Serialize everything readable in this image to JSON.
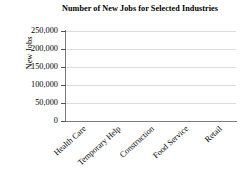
{
  "chart_data": {
    "type": "bar",
    "title": "Number of New Jobs for Selected Industries",
    "xlabel": "",
    "ylabel": "New Jobs",
    "categories": [
      "Health Care",
      "Temporary Help",
      "Construction",
      "Food Service",
      "Retail"
    ],
    "values": [
      null,
      null,
      null,
      null,
      null
    ],
    "ytick_labels": [
      "250,000",
      "200,000",
      "150,000",
      "100,000",
      "50,000",
      "0"
    ],
    "ytick_values": [
      250000,
      200000,
      150000,
      100000,
      50000,
      0
    ],
    "ylim": [
      0,
      250000
    ],
    "ytick_interval": 50000,
    "grid": "horizontal",
    "legend": "none",
    "series": [
      {
        "name": "New Jobs",
        "values": [
          null,
          null,
          null,
          null,
          null
        ]
      }
    ],
    "colors": {
      "background": "#ffffff",
      "gridline": "#dcdcdc",
      "axis": "#7d7d7d",
      "tick": "#555555",
      "text": "#000000"
    }
  }
}
